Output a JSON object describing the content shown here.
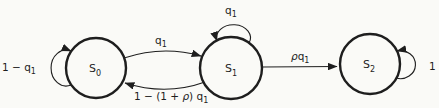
{
  "colors": {
    "paper": "#fafaf7",
    "ink": "#1e1e1e"
  },
  "diagram": {
    "type": "state-transition-diagram",
    "states": [
      {
        "id": "S0",
        "name": "S",
        "sub": "0"
      },
      {
        "id": "S1",
        "name": "S",
        "sub": "1"
      },
      {
        "id": "S2",
        "name": "S",
        "sub": "2"
      }
    ],
    "transitions": [
      {
        "from": "S0",
        "to": "S0",
        "label": "1 − q1"
      },
      {
        "from": "S0",
        "to": "S1",
        "label": "q1"
      },
      {
        "from": "S1",
        "to": "S0",
        "label": "1 − (1 + ρ) q1"
      },
      {
        "from": "S1",
        "to": "S1",
        "label": "q1"
      },
      {
        "from": "S1",
        "to": "S2",
        "label": "ρq1"
      },
      {
        "from": "S2",
        "to": "S2",
        "label": "1"
      }
    ],
    "labels": {
      "s0_self": {
        "pre": "1 − q",
        "sub": "1"
      },
      "s0_to_s1": {
        "pre": "q",
        "sub": "1"
      },
      "s1_to_s0": {
        "pre": "1 − (1 + ",
        "rho": "ρ",
        "post": ") q",
        "sub": "1"
      },
      "s1_self": {
        "pre": "q",
        "sub": "1"
      },
      "s1_to_s2": {
        "rho": "ρ",
        "post": "q",
        "sub": "1"
      },
      "s2_self": {
        "value": "1"
      }
    }
  }
}
